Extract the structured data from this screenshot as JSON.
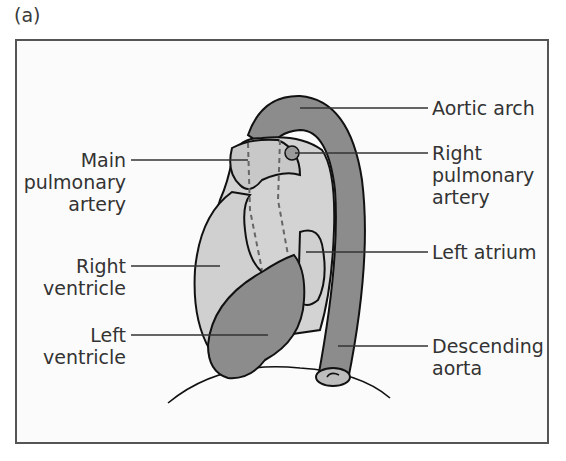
{
  "panel_label": "(a)",
  "colors": {
    "frame_border": "#555555",
    "frame_bg": "#fbfbfb",
    "dark_gray_fill": "#8c8c8c",
    "light_gray_fill": "#cfcfcf",
    "outline": "#111111",
    "leader_line": "#333333"
  },
  "labels": {
    "main_pulmonary_artery": {
      "line1": "Main",
      "line2": "pulmonary",
      "line3": "artery"
    },
    "right_ventricle": {
      "line1": "Right",
      "line2": "ventricle"
    },
    "left_ventricle": {
      "line1": "Left",
      "line2": "ventricle"
    },
    "aortic_arch": {
      "line1": "Aortic arch"
    },
    "right_pulmonary_artery": {
      "line1": "Right",
      "line2": "pulmonary",
      "line3": "artery"
    },
    "left_atrium": {
      "line1": "Left atrium"
    },
    "descending_aorta": {
      "line1": "Descending",
      "line2": "aorta"
    }
  }
}
